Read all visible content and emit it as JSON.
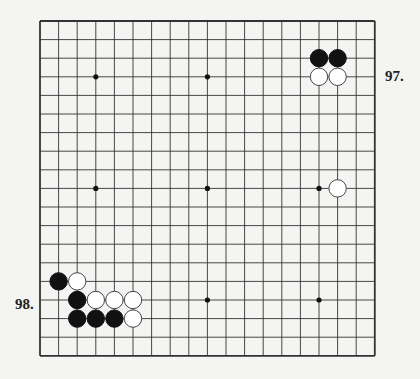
{
  "board": {
    "size": 19,
    "origin_x": 40,
    "origin_y": 21,
    "spacing": 18.6,
    "line_color": "#333333",
    "hoshi": [
      [
        3,
        3
      ],
      [
        9,
        3
      ],
      [
        15,
        3
      ],
      [
        3,
        9
      ],
      [
        9,
        9
      ],
      [
        15,
        9
      ],
      [
        3,
        15
      ],
      [
        9,
        15
      ],
      [
        15,
        15
      ]
    ],
    "stones": [
      {
        "color": "black",
        "x": 15,
        "y": 2
      },
      {
        "color": "black",
        "x": 16,
        "y": 2
      },
      {
        "color": "white",
        "x": 15,
        "y": 3
      },
      {
        "color": "white",
        "x": 16,
        "y": 3
      },
      {
        "color": "white",
        "x": 16,
        "y": 9
      },
      {
        "color": "black",
        "x": 1,
        "y": 14
      },
      {
        "color": "white",
        "x": 2,
        "y": 14
      },
      {
        "color": "black",
        "x": 2,
        "y": 15
      },
      {
        "color": "white",
        "x": 3,
        "y": 15
      },
      {
        "color": "white",
        "x": 4,
        "y": 15
      },
      {
        "color": "white",
        "x": 5,
        "y": 15
      },
      {
        "color": "black",
        "x": 2,
        "y": 16
      },
      {
        "color": "black",
        "x": 3,
        "y": 16
      },
      {
        "color": "black",
        "x": 4,
        "y": 16
      },
      {
        "color": "white",
        "x": 5,
        "y": 16
      }
    ]
  },
  "labels": {
    "problem_97": "97.",
    "problem_98": "98."
  }
}
